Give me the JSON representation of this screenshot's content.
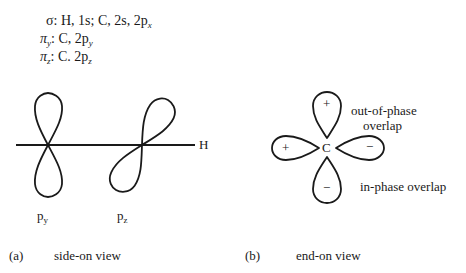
{
  "legend": {
    "sigma": {
      "symbol": "σ",
      "text": ": H, 1s; C, 2s, 2p",
      "sub": "x"
    },
    "pi_y": {
      "symbol": "π",
      "symsub": "y",
      "text": ": C, 2p",
      "sub": "y"
    },
    "pi_z": {
      "symbol": "π",
      "symsub": "z",
      "text": ": C. 2p",
      "sub": "z"
    }
  },
  "side_view": {
    "axis_label": "H",
    "orbitals": [
      {
        "label": "p",
        "sub": "y"
      },
      {
        "label": "p",
        "sub": "z"
      }
    ]
  },
  "end_view": {
    "center_label": "C",
    "lobe_signs": {
      "top": "+",
      "left": "+",
      "right": "−",
      "bottom": "−"
    },
    "annotations": {
      "out_of_phase_line1": "out-of-phase",
      "out_of_phase_line2": "overlap",
      "in_phase": "in-phase overlap"
    }
  },
  "captions": {
    "a_tag": "(a)",
    "a_text": "side-on view",
    "b_tag": "(b)",
    "b_text": "end-on view"
  },
  "colors": {
    "line": "#1a1a1a",
    "background": "#ffffff"
  }
}
